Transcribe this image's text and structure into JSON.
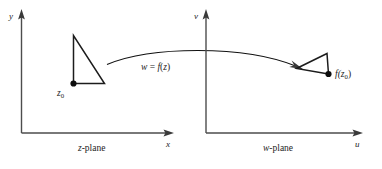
{
  "figure": {
    "background_color": "#ffffff",
    "line_color": "#1c1c1c",
    "axis_color": "#4d4d4d"
  },
  "left_panel": {
    "name": "z-plane",
    "plane_label_prefix": "z",
    "plane_label_suffix": "-plane",
    "vertical_axis_label": "y",
    "horizontal_axis_label": "x",
    "point_label_base": "z",
    "point_label_subscript": "0",
    "point": {
      "x": 0.0,
      "y": 0.0
    },
    "shape": {
      "type": "triangle",
      "vertices": [
        {
          "x": 0.0,
          "y": 0.0
        },
        {
          "x": 0.0,
          "y": 2.35
        },
        {
          "x": 1.35,
          "y": 0.0
        }
      ]
    }
  },
  "right_panel": {
    "name": "w-plane",
    "plane_label_prefix": "w",
    "plane_label_suffix": "-plane",
    "vertical_axis_label": "v",
    "horizontal_axis_label": "u",
    "point_label_prefix": "f(",
    "point_label_base": "z",
    "point_label_subscript": "0",
    "point_label_suffix": ")",
    "point": {
      "x": 0.0,
      "y": 0.0
    },
    "shape": {
      "type": "triangle",
      "vertices": [
        {
          "x": 0.0,
          "y": 0.0
        },
        {
          "x": -1.55,
          "y": -0.45
        },
        {
          "x": -0.05,
          "y": 1.0
        }
      ]
    }
  },
  "mapping_arrow": {
    "label_w": "w",
    "label_eq": " = ",
    "label_f": "f",
    "label_open": "(",
    "label_z": "z",
    "label_close": ")",
    "full_label": "w = f(z)",
    "direction": "left-to-right"
  }
}
